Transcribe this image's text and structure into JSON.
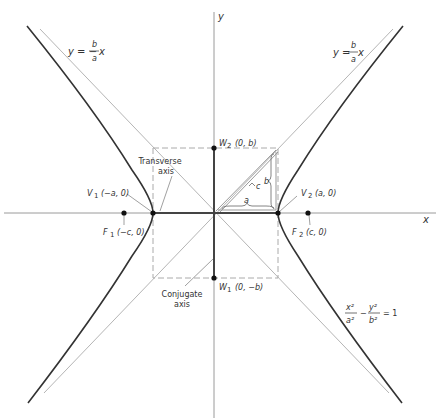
{
  "diagram": {
    "type": "hyperbola",
    "equation": {
      "x_num": "x²",
      "x_den": "a²",
      "minus": "−",
      "y_num": "y²",
      "y_den": "b²",
      "rhs": "= 1"
    },
    "axes": {
      "x_label": "x",
      "y_label": "y"
    },
    "asymptotes": {
      "negative": {
        "lhs": "y = −",
        "num": "b",
        "den": "a",
        "var": "x"
      },
      "positive": {
        "lhs": "y = ",
        "num": "b",
        "den": "a",
        "var": "x"
      }
    },
    "points": {
      "V1": {
        "name": "V",
        "sub": "1",
        "coords": "(−a, 0)"
      },
      "V2": {
        "name": "V",
        "sub": "2",
        "coords": "(a, 0)"
      },
      "F1": {
        "name": "F",
        "sub": "1",
        "coords": "(−c, 0)"
      },
      "F2": {
        "name": "F",
        "sub": "2",
        "coords": "(c, 0)"
      },
      "W1": {
        "name": "W",
        "sub": "1",
        "coords": "(0, −b)"
      },
      "W2": {
        "name": "W",
        "sub": "2",
        "coords": "(0, b)"
      }
    },
    "segment_labels": {
      "a": "a",
      "b": "b",
      "c": "c"
    },
    "callouts": {
      "transverse_line1": "Transverse",
      "transverse_line2": "axis",
      "conjugate_line1": "Conjugate",
      "conjugate_line2": "axis"
    },
    "colors": {
      "curve": "#333333",
      "asymptote": "#b5b5b5",
      "axis": "#9a9a9a",
      "dashed_box": "#aaaaaa",
      "text": "#333333"
    }
  }
}
